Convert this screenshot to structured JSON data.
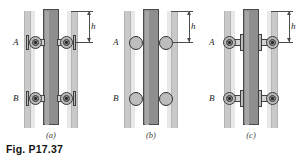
{
  "figure": {
    "caption": "Fig. P17.37",
    "panels": [
      {
        "id": "a",
        "sub_caption": "(a)",
        "roller_style": "wheel-with-hub-bracketed",
        "point_labels": {
          "upper": "A",
          "lower": "B"
        },
        "dimension": {
          "label": "h",
          "from": "top of rail",
          "to": "point A"
        }
      },
      {
        "id": "b",
        "sub_caption": "(b)",
        "roller_style": "plain-circle",
        "point_labels": {
          "upper": "A",
          "lower": "B"
        },
        "dimension": {
          "label": "h",
          "from": "top of rail",
          "to": "point A"
        }
      },
      {
        "id": "c",
        "sub_caption": "(c)",
        "roller_style": "wheel-with-hub-outboard",
        "point_labels": {
          "upper": "A",
          "lower": "B"
        },
        "dimension": {
          "label": "h",
          "from": "top of rail",
          "to": "point A"
        }
      }
    ]
  },
  "colors": {
    "background": "#ffffff",
    "rail_fill": "#c9c9c9",
    "column_fill": "#8e8e8e",
    "column_outline": "#4a4a4a",
    "roller_fill": "#b9b9b9",
    "roller_outline": "#3a3a3a",
    "dimension_line": "#4c4c4c",
    "text": "#111111"
  }
}
